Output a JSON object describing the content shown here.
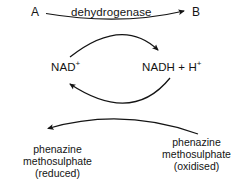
{
  "diagram": {
    "substrate_label": "A",
    "product_label": "B",
    "enzyme_label": "dehydrogenase",
    "cofactor_oxidised": {
      "base": "NAD",
      "superscript": "+"
    },
    "cofactor_reduced": {
      "base": "NADH + H",
      "superscript": "+"
    },
    "mediator_reduced": {
      "line1": "phenazine",
      "line2": "methosulphate",
      "line3": "(reduced)"
    },
    "mediator_oxidised": {
      "line1": "phenazine",
      "line2": "methosulphate",
      "line3": "(oxidised)"
    },
    "colors": {
      "stroke": "#141414",
      "text": "#141414",
      "background": "#ffffff"
    }
  }
}
